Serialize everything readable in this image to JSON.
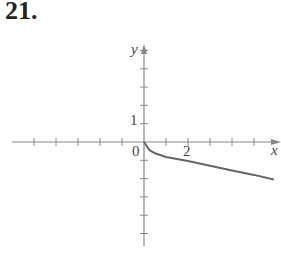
{
  "problem_number": "21.",
  "chart_data": {
    "type": "line",
    "title": "",
    "xlabel": "x",
    "ylabel": "y",
    "origin_label": "0",
    "x_tick_label": "2",
    "y_tick_label": "1",
    "xlim": [
      -5,
      6
    ],
    "ylim": [
      -5,
      5
    ],
    "x_ticks": [
      -5,
      -4,
      -3,
      -2,
      -1,
      1,
      2,
      3,
      4,
      5
    ],
    "y_ticks": [
      -5,
      -4,
      -3,
      -2,
      -1,
      1,
      2,
      3,
      4,
      5
    ],
    "grid": false,
    "series": [
      {
        "name": "curve",
        "x": [
          0,
          0.25,
          0.5,
          1,
          2,
          3,
          4,
          5,
          5.9
        ],
        "y": [
          0,
          -0.45,
          -0.62,
          -0.82,
          -1.04,
          -1.3,
          -1.55,
          -1.8,
          -2.05
        ]
      }
    ],
    "colors": {
      "axis": "#888888",
      "curve": "#666666",
      "text": "#444444"
    }
  }
}
